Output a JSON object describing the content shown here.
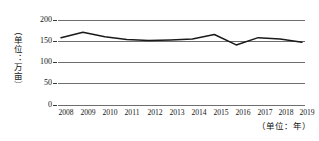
{
  "chart_data": {
    "type": "line",
    "title": "",
    "subtitle": "",
    "xlabel": "（单位：年）",
    "ylabel": "（单位：万亩）",
    "categories": [
      "2008",
      "2009",
      "2010",
      "2011",
      "2012",
      "2013",
      "2014",
      "2015",
      "2016",
      "2017",
      "2018",
      "2019"
    ],
    "values": [
      148,
      160,
      150,
      144,
      142,
      143,
      145,
      155,
      132,
      148,
      145,
      138
    ],
    "series": [
      {
        "name": "面积",
        "values": [
          148,
          160,
          150,
          144,
          142,
          143,
          145,
          155,
          132,
          148,
          145,
          138
        ]
      }
    ],
    "ylim": [
      0,
      200
    ],
    "yticks": [
      0,
      50,
      100,
      150,
      200
    ],
    "ytick_labels": [
      "0",
      "50",
      "100",
      "150",
      "200"
    ],
    "xlim": [
      "2008",
      "2019"
    ],
    "grid": true,
    "grid_axis": "y",
    "legend": false,
    "legend_position": "none",
    "line_color": "#1a1a1a",
    "grid_color": "#6e6e6e",
    "markers": false
  },
  "axes": {
    "y_title": "（单位：万亩）",
    "x_title": "（单位：年）",
    "y_tick_labels": [
      "200",
      "150",
      "100",
      "50",
      "0"
    ],
    "x_tick_labels": [
      "2008",
      "2009",
      "2010",
      "2011",
      "2012",
      "2013",
      "2014",
      "2015",
      "2016",
      "2017",
      "2018",
      "2019"
    ]
  }
}
